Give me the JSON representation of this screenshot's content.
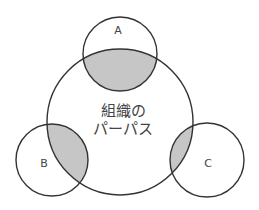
{
  "diagram": {
    "type": "venn",
    "center": {
      "label_line1": "組織の",
      "label_line2": "パーパス",
      "cx": 120,
      "cy": 122,
      "r": 73
    },
    "satellites": [
      {
        "id": "A",
        "label": "A",
        "cx": 120,
        "cy": 54,
        "r": 37
      },
      {
        "id": "B",
        "label": "B",
        "cx": 52,
        "cy": 160,
        "r": 36
      },
      {
        "id": "C",
        "label": "C",
        "cx": 207,
        "cy": 160,
        "r": 37
      }
    ],
    "colors": {
      "stroke": "#333333",
      "overlap_fill": "#c6c6c6",
      "background": "#ffffff"
    }
  }
}
